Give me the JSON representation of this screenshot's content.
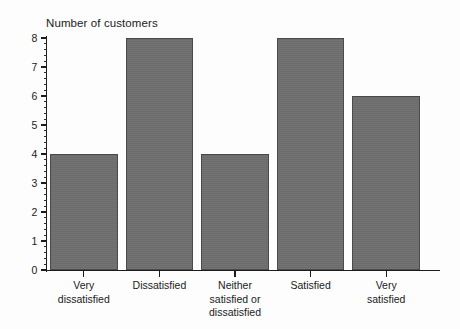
{
  "chart_data": {
    "type": "bar",
    "title": "Number of customers",
    "xlabel": "",
    "ylabel": "",
    "categories": [
      "Very\ndissatisfied",
      "Dissatisfied",
      "Neither\nsatisfied or\ndissatisfied",
      "Satisfied",
      "Very\nsatisfied"
    ],
    "values": [
      4,
      8,
      4,
      8,
      6
    ],
    "ylim": [
      0,
      8
    ],
    "y_major_ticks": [
      0,
      1,
      2,
      3,
      4,
      5,
      6,
      7,
      8
    ],
    "y_tick_labels": [
      "0",
      "1",
      "2",
      "3",
      "4",
      "5",
      "6",
      "7",
      "8"
    ],
    "y_minor_tick_interval": 0.2,
    "grid": false,
    "legend": false,
    "bar_fill_color": "#6e6e6e",
    "bar_edge_color": "#4a4a4a",
    "axis_color": "#1c1c1c",
    "background_color": "#fdfdfd"
  }
}
